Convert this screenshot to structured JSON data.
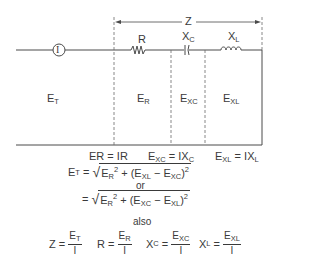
{
  "diagram": {
    "type": "series RLC circuit voltage/impedance relationships",
    "circuit": {
      "meter_label": "I",
      "source_label": "E",
      "source_sub": "T",
      "span_label": "Z",
      "components": [
        {
          "name": "resistor",
          "label": "R",
          "label_sub": ""
        },
        {
          "name": "capacitor",
          "label": "X",
          "label_sub": "C"
        },
        {
          "name": "inductor",
          "label": "X",
          "label_sub": "L"
        }
      ],
      "section_voltages": [
        {
          "label": "E",
          "sub": "R"
        },
        {
          "label": "E",
          "sub": "XC"
        },
        {
          "label": "E",
          "sub": "XL"
        }
      ]
    },
    "relations": [
      {
        "lhs": "ER",
        "rhs": "= IR"
      },
      {
        "lhs": "E",
        "lhs_sub": "XC",
        "rhs": "= IX",
        "rhs_sub": "C"
      },
      {
        "lhs": "E",
        "lhs_sub": "XL",
        "rhs": "= IX",
        "rhs_sub": "L"
      }
    ],
    "formula1": {
      "lhs": "E",
      "lhs_sub": "T",
      "eq": "=",
      "a": "E",
      "a_sub": "R",
      "sq": "2",
      "plus": "+ (E",
      "b_sub": "XL",
      "minus": "− E",
      "c_sub": "XC",
      "close": ")",
      "sq2": "2"
    },
    "or_text": "or",
    "formula2": {
      "eq": "=",
      "a": "E",
      "a_sub": "R",
      "sq": "2",
      "plus": "+ (E",
      "b_sub": "XC",
      "minus": "− E",
      "c_sub": "XL",
      "close": ")",
      "sq2": "2"
    },
    "also_text": "also",
    "ratios": [
      {
        "lhs": "Z =",
        "num": "E",
        "num_sub": "T",
        "den": "I"
      },
      {
        "lhs": "R =",
        "num": "E",
        "num_sub": "R",
        "den": "I"
      },
      {
        "lhs": "X",
        "lhs_sub": "C",
        "lhs_eq": "=",
        "num": "E",
        "num_sub": "XC",
        "den": "I"
      },
      {
        "lhs": "X",
        "lhs_sub": "L",
        "lhs_eq": "=",
        "num": "E",
        "num_sub": "XL",
        "den": "I"
      }
    ]
  }
}
